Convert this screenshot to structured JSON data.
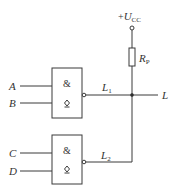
{
  "supply": {
    "prefix": "+",
    "symbol": "U",
    "subscript": "CC"
  },
  "resistor": {
    "symbol": "R",
    "subscript": "P"
  },
  "gates": [
    {
      "id": "gate-1",
      "function_symbol": "&",
      "output_type_symbol": "open-collector",
      "output_type_glyph": "◇",
      "inputs": [
        "A",
        "B"
      ],
      "output_label": {
        "symbol": "L",
        "subscript": "1"
      }
    },
    {
      "id": "gate-2",
      "function_symbol": "&",
      "output_type_symbol": "open-collector",
      "output_type_glyph": "◇",
      "inputs": [
        "C",
        "D"
      ],
      "output_label": {
        "symbol": "L",
        "subscript": "2"
      }
    }
  ],
  "output": {
    "label": "L"
  },
  "colors": {
    "line": "#3a3a3a",
    "text": "#333333",
    "background": "#ffffff"
  }
}
